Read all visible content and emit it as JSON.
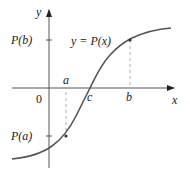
{
  "diagram": {
    "axes": {
      "x_label": "x",
      "y_label": "y",
      "origin_label": "0"
    },
    "curve_label": "y = P(x)",
    "points": {
      "a": {
        "label": "a",
        "value_label": "P(a)"
      },
      "b": {
        "label": "b",
        "value_label": "P(b)"
      },
      "c": {
        "label": "c"
      }
    },
    "colors": {
      "axis": "#444444",
      "curve": "#555555",
      "dashed": "#888888",
      "text": "#222222"
    }
  }
}
